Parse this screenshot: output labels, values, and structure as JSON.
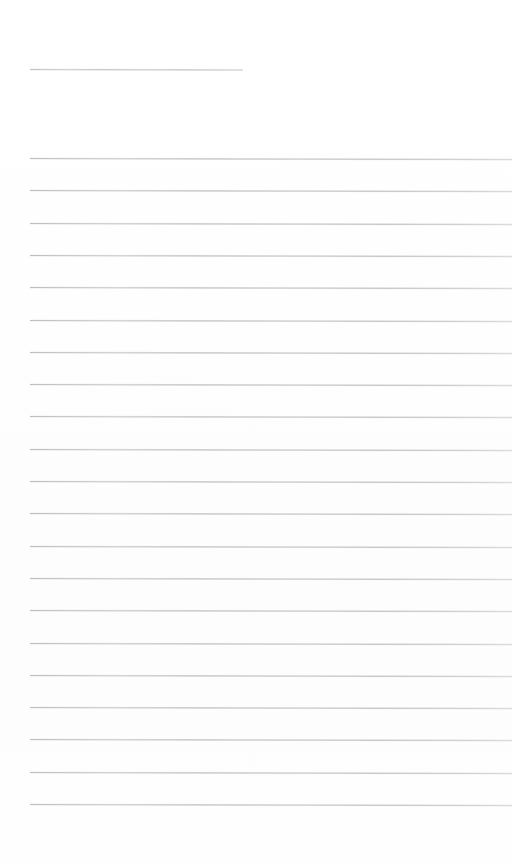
{
  "document": {
    "type": "scanned-ruled-paper",
    "title": "",
    "page_width": 512,
    "page_height": 866,
    "background_color": "#fefefe",
    "rule_color": "#bcc0c4",
    "rule_thickness_px": 1,
    "content_text": "",
    "is_blank": true
  },
  "layout": {
    "left_margin_px": 30,
    "right_edge_px": 512,
    "top_blank_height_px": 69,
    "gap_after_header_rule_px": 89,
    "rule_spacing_px": 32.3,
    "bottom_blank_height_px": 49,
    "skew_deg": 0.12
  },
  "header_rule": {
    "name": "title-rule",
    "y": 69,
    "x_start": 30,
    "x_end": 243,
    "width": 213,
    "color": "#c2c6ca"
  },
  "body_rules": [
    {
      "index": 1,
      "y": 158.0,
      "x_start": 30,
      "width": 482
    },
    {
      "index": 2,
      "y": 190.3,
      "x_start": 30,
      "width": 482
    },
    {
      "index": 3,
      "y": 222.6,
      "x_start": 30,
      "width": 482
    },
    {
      "index": 4,
      "y": 254.9,
      "x_start": 30,
      "width": 482
    },
    {
      "index": 5,
      "y": 287.2,
      "x_start": 30,
      "width": 482
    },
    {
      "index": 6,
      "y": 319.5,
      "x_start": 30,
      "width": 482
    },
    {
      "index": 7,
      "y": 351.8,
      "x_start": 30,
      "width": 482
    },
    {
      "index": 8,
      "y": 384.1,
      "x_start": 30,
      "width": 482
    },
    {
      "index": 9,
      "y": 416.4,
      "x_start": 30,
      "width": 482
    },
    {
      "index": 10,
      "y": 448.7,
      "x_start": 30,
      "width": 482
    },
    {
      "index": 11,
      "y": 481.0,
      "x_start": 30,
      "width": 482
    },
    {
      "index": 12,
      "y": 513.3,
      "x_start": 30,
      "width": 482
    },
    {
      "index": 13,
      "y": 545.6,
      "x_start": 30,
      "width": 482
    },
    {
      "index": 14,
      "y": 577.9,
      "x_start": 30,
      "width": 482
    },
    {
      "index": 15,
      "y": 610.2,
      "x_start": 30,
      "width": 482
    },
    {
      "index": 16,
      "y": 642.5,
      "x_start": 30,
      "width": 482
    },
    {
      "index": 17,
      "y": 674.8,
      "x_start": 30,
      "width": 482
    },
    {
      "index": 18,
      "y": 707.1,
      "x_start": 30,
      "width": 482
    },
    {
      "index": 19,
      "y": 739.4,
      "x_start": 30,
      "width": 482
    },
    {
      "index": 20,
      "y": 771.7,
      "x_start": 30,
      "width": 482
    },
    {
      "index": 21,
      "y": 804.0,
      "x_start": 30,
      "width": 482
    }
  ]
}
